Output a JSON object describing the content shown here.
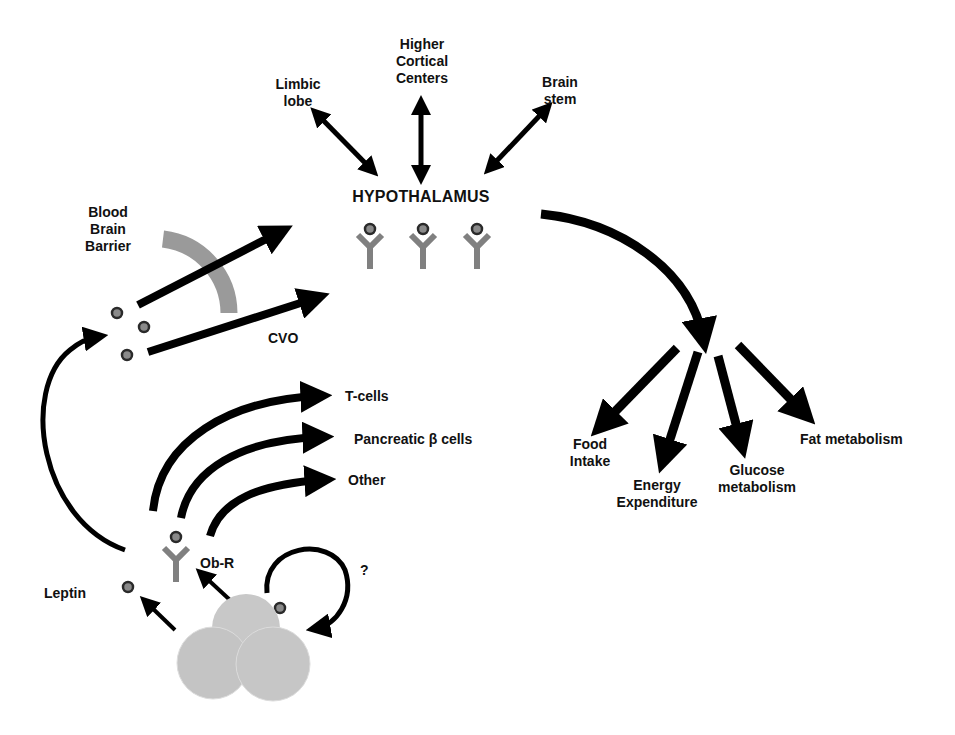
{
  "diagram": {
    "center_label": "HYPOTHALAMUS",
    "brain_regions": [
      {
        "label_line1": "Limbic",
        "label_line2": "lobe"
      },
      {
        "label_line1": "Higher",
        "label_line2": "Cortical",
        "label_line3": "Centers"
      },
      {
        "label_line1": "Brain",
        "label_line2": "stem"
      }
    ],
    "transport": {
      "bbb_line1": "Blood",
      "bbb_line2": "Brain",
      "bbb_line3": "Barrier",
      "cvo": "CVO"
    },
    "peripheral_targets": [
      {
        "label": "T-cells"
      },
      {
        "label": "Pancreatic β cells"
      },
      {
        "label": "Other"
      }
    ],
    "receptor_label": "Ob-R",
    "ligand_label": "Leptin",
    "autocrine_label": "?",
    "outputs": [
      {
        "label_line1": "Food",
        "label_line2": "Intake"
      },
      {
        "label_line1": "Energy",
        "label_line2": "Expenditure"
      },
      {
        "label_line1": "Glucose",
        "label_line2": "metabolism"
      },
      {
        "label_line1": "Fat metabolism"
      }
    ],
    "colors": {
      "arrow": "#000000",
      "receptor": "#808080",
      "barrier": "#9a9a9a",
      "adipocyte": "#c8c8c8",
      "leptin_fill": "#8a8a8a",
      "leptin_ring": "#2a2a2a"
    }
  }
}
